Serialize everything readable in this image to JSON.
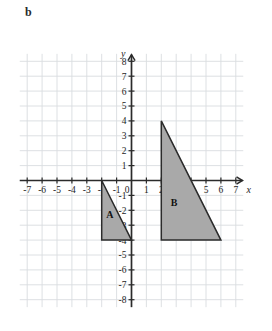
{
  "part_label": "b",
  "colors": {
    "grid": "#d9dde0",
    "axis": "#2b2b2b",
    "shape_fill": "#a9a9a9",
    "shape_stroke": "#2b2b2b",
    "text": "#1d1d1d",
    "background": "#ffffff"
  },
  "axes": {
    "x_name": "x",
    "y_name": "y",
    "origin_label": "0",
    "x_ticks": [
      "-7",
      "-6",
      "-5",
      "-4",
      "-3",
      "-2",
      "-1",
      "1",
      "2",
      "3",
      "4",
      "5",
      "6",
      "7"
    ],
    "y_ticks": [
      "8",
      "7",
      "6",
      "5",
      "4",
      "3",
      "2",
      "1",
      "-1",
      "-2",
      "-3",
      "-4",
      "-5",
      "-6",
      "-7",
      "-8"
    ]
  },
  "chart_data": {
    "type": "scatter",
    "title": "",
    "xlabel": "x",
    "ylabel": "y",
    "xlim": [
      -7.5,
      7.5
    ],
    "ylim": [
      -8.5,
      8.5
    ],
    "xticks": [
      -7,
      -6,
      -5,
      -4,
      -3,
      -2,
      -1,
      0,
      1,
      2,
      3,
      4,
      5,
      6,
      7
    ],
    "yticks": [
      -8,
      -7,
      -6,
      -5,
      -4,
      -3,
      -2,
      -1,
      0,
      1,
      2,
      3,
      4,
      5,
      6,
      7,
      8
    ],
    "grid": true,
    "grid_step": 1,
    "legend": "none",
    "shapes": [
      {
        "name": "A",
        "type": "triangle",
        "label": "A",
        "label_position": [
          -1.45,
          -2.3
        ],
        "vertices": [
          [
            -2,
            0
          ],
          [
            -2,
            -4
          ],
          [
            0,
            -4
          ]
        ],
        "fill": "#a9a9a9",
        "stroke": "#2b2b2b"
      },
      {
        "name": "B",
        "type": "triangle",
        "label": "B",
        "label_position": [
          2.85,
          -1.45
        ],
        "vertices": [
          [
            2,
            4
          ],
          [
            2,
            -4
          ],
          [
            6,
            -4
          ]
        ],
        "fill": "#a9a9a9",
        "stroke": "#2b2b2b"
      }
    ]
  }
}
